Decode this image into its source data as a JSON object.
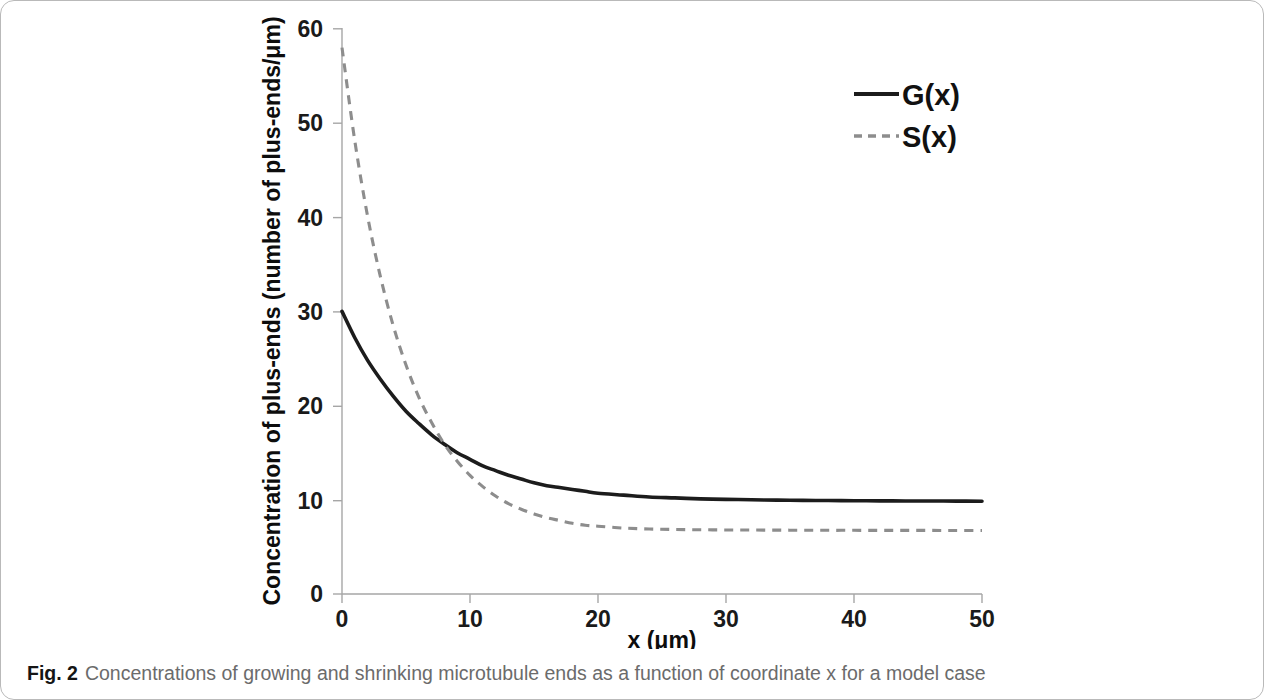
{
  "figure": {
    "caption_label": "Fig. 2",
    "caption_text": "Concentrations of growing and shrinking microtubule ends as a function of coordinate x for a model case"
  },
  "chart_data": {
    "type": "line",
    "title": "",
    "xlabel": "x (μm)",
    "ylabel": "Concentration of plus-ends (number of plus-ends/μm)",
    "xlim": [
      0,
      50
    ],
    "ylim": [
      0,
      60
    ],
    "xticks": [
      "0",
      "10",
      "20",
      "30",
      "40",
      "50"
    ],
    "yticks": [
      "0",
      "10",
      "20",
      "30",
      "40",
      "50",
      "60"
    ],
    "xtick_values": [
      0,
      10,
      20,
      30,
      40,
      50
    ],
    "ytick_values": [
      0,
      10,
      20,
      30,
      40,
      50,
      60
    ],
    "grid": false,
    "legend_position": "top-right",
    "x": [
      0,
      1,
      2,
      3,
      4,
      5,
      6,
      7,
      8,
      9,
      10,
      11,
      12,
      13,
      14,
      15,
      16,
      17,
      18,
      19,
      20,
      22,
      24,
      26,
      28,
      30,
      32,
      34,
      36,
      38,
      40,
      42,
      44,
      46,
      48,
      50
    ],
    "series": [
      {
        "name": "G(x)",
        "style": "solid",
        "color": "#1c1c1c",
        "values": [
          30.0,
          27.2,
          24.8,
          22.8,
          21.0,
          19.4,
          18.1,
          16.9,
          15.9,
          15.0,
          14.3,
          13.6,
          13.1,
          12.6,
          12.2,
          11.8,
          11.5,
          11.3,
          11.1,
          10.9,
          10.7,
          10.5,
          10.3,
          10.2,
          10.1,
          10.05,
          10.0,
          9.97,
          9.94,
          9.92,
          9.9,
          9.89,
          9.88,
          9.87,
          9.86,
          9.85
        ]
      },
      {
        "name": "S(x)",
        "style": "dashed",
        "color": "#8d8d8d",
        "values": [
          58.0,
          48.1,
          40.1,
          33.7,
          28.5,
          24.3,
          20.9,
          18.2,
          15.9,
          14.1,
          12.6,
          11.4,
          10.4,
          9.6,
          9.0,
          8.5,
          8.1,
          7.8,
          7.5,
          7.3,
          7.2,
          7.0,
          6.9,
          6.85,
          6.82,
          6.8,
          6.79,
          6.78,
          6.77,
          6.76,
          6.76,
          6.75,
          6.75,
          6.75,
          6.74,
          6.74
        ]
      }
    ]
  }
}
